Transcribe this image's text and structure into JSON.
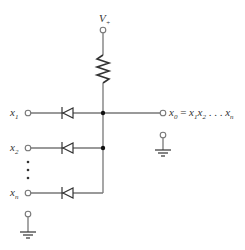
{
  "diagram": {
    "supply": {
      "label": "V",
      "subscript": "+"
    },
    "inputs": [
      {
        "label": "x",
        "subscript": "1"
      },
      {
        "label": "x",
        "subscript": "2"
      },
      {
        "label": "x",
        "subscript": "n"
      }
    ],
    "ellipsis": "• • •",
    "output": {
      "lhs": "x",
      "lhs_sub": "0",
      "eq": " = ",
      "t1": "x",
      "t1_sub": "1",
      "t2": "x",
      "t2_sub": "2",
      "dots": " . . . ",
      "t3": "x",
      "t3_sub": "n"
    },
    "colors": {
      "wire": "#777777",
      "node": "#111111",
      "text": "#333333"
    }
  }
}
